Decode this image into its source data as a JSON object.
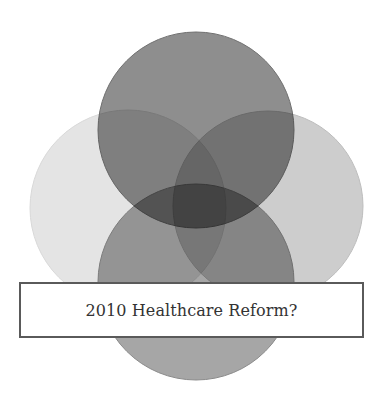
{
  "diagram": {
    "type": "overlapping-circles",
    "caption": "2010 Healthcare Reform?",
    "circles": [
      {
        "name": "left-circle",
        "cx": 128,
        "cy": 208,
        "r": 98,
        "color": "#e4e4e4",
        "stroke": "#d8d8d8"
      },
      {
        "name": "right-circle",
        "cx": 268,
        "cy": 206,
        "r": 95,
        "color": "#cdcdcd",
        "stroke": "#bdbdbd"
      },
      {
        "name": "top-circle",
        "cx": 196,
        "cy": 130,
        "r": 98,
        "color": "#8e8e8e",
        "stroke": "#6f6f6f"
      },
      {
        "name": "bottom-circle",
        "cx": 196,
        "cy": 282,
        "r": 98,
        "color": "#a6a6a6",
        "stroke": "#8a8a8a"
      }
    ],
    "box_border_color": "#5a5a5a",
    "text_color": "#333333"
  }
}
